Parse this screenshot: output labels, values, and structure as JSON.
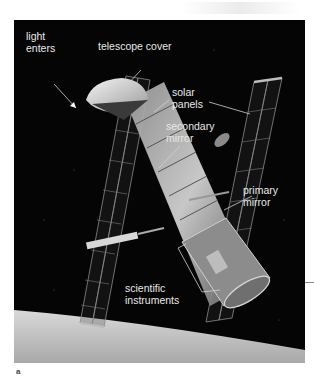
{
  "figure": {
    "panel_letter": "a",
    "colors": {
      "background": "#050505",
      "label_text": "#e8e8e8",
      "leader_lines": "#d0d0d0",
      "earth_surface": "#cfcfcf"
    },
    "labels": {
      "light_enters": {
        "line1": "light",
        "line2": "enters"
      },
      "telescope_cover": {
        "line1": "telescope cover"
      },
      "solar_panels": {
        "line1": "solar",
        "line2": "panels"
      },
      "secondary_mirror": {
        "line1": "secondary",
        "line2": "mirror"
      },
      "primary_mirror": {
        "line1": "primary",
        "line2": "mirror"
      },
      "scientific_instruments": {
        "line1": "scientific",
        "line2": "instruments"
      }
    }
  }
}
